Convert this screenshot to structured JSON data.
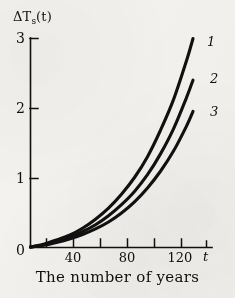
{
  "figure": {
    "background_color": "#f4f3f0",
    "ink_color": "#101010"
  },
  "chart_data": {
    "type": "line",
    "title": "",
    "subtitle": "",
    "xlabel": "The number of years",
    "x_axis_variable": "t",
    "ylabel": "ΔT",
    "ylabel_subscript": "s",
    "ylabel_argument": "(t)",
    "ylabel_full": "ΔTs(t)",
    "xlim": [
      0,
      132
    ],
    "ylim": [
      0,
      3.15
    ],
    "grid": false,
    "legend": "inline-curve-labels-right",
    "x_ticks_major": [
      0,
      40,
      80,
      120
    ],
    "x_ticks_minor": [
      20,
      60,
      100
    ],
    "x_tick_labels": [
      "0",
      "40",
      "80",
      "120"
    ],
    "y_ticks": [
      1,
      2,
      3
    ],
    "y_tick_labels": [
      "1",
      "2",
      "3"
    ],
    "x": [
      0,
      10,
      20,
      30,
      40,
      50,
      60,
      70,
      80,
      90,
      100,
      110,
      120,
      125
    ],
    "series": [
      {
        "name": "1",
        "label": "1",
        "end_x": 125,
        "end_y": 3.0,
        "values": [
          0,
          0.04,
          0.1,
          0.17,
          0.27,
          0.4,
          0.56,
          0.76,
          1.0,
          1.3,
          1.68,
          2.12,
          2.68,
          3.0
        ]
      },
      {
        "name": "2",
        "label": "2",
        "end_x": 125,
        "end_y": 2.4,
        "values": [
          0,
          0.03,
          0.08,
          0.14,
          0.22,
          0.32,
          0.45,
          0.61,
          0.8,
          1.04,
          1.34,
          1.7,
          2.15,
          2.4
        ]
      },
      {
        "name": "3",
        "label": "3",
        "end_x": 125,
        "end_y": 1.95,
        "values": [
          0,
          0.025,
          0.065,
          0.115,
          0.18,
          0.26,
          0.36,
          0.49,
          0.65,
          0.85,
          1.09,
          1.38,
          1.74,
          1.95
        ]
      }
    ]
  }
}
